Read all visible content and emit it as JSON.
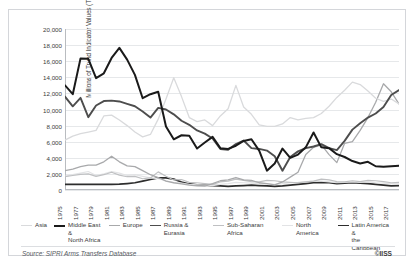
{
  "top_partial_title": "",
  "source_note": "Source: SIPRI Arms Transfers Database",
  "copyright": "©IISS",
  "chart_data": {
    "type": "line",
    "title": "",
    "xlabel": "",
    "ylabel": "Millions of Trend Indicator Values (TIV)",
    "ylim": [
      0,
      20000
    ],
    "ytick_values": [
      0,
      2000,
      4000,
      6000,
      8000,
      10000,
      12000,
      14000,
      16000,
      18000,
      20000
    ],
    "ytick_labels": [
      "0",
      "2,000",
      "4,000",
      "6,000",
      "8,000",
      "10,000",
      "12,000",
      "14,000",
      "16,000",
      "18,000",
      "20,000"
    ],
    "grid": true,
    "legend_position": "bottom",
    "x": [
      1975,
      1976,
      1977,
      1978,
      1979,
      1980,
      1981,
      1982,
      1983,
      1984,
      1985,
      1986,
      1987,
      1988,
      1989,
      1990,
      1991,
      1992,
      1993,
      1994,
      1995,
      1996,
      1997,
      1998,
      1999,
      2000,
      2001,
      2002,
      2003,
      2004,
      2005,
      2006,
      2007,
      2008,
      2009,
      2010,
      2011,
      2012,
      2013,
      2014,
      2015,
      2016,
      2017,
      2018
    ],
    "xtick_labels": [
      "1975",
      "1977",
      "1979",
      "1981",
      "1983",
      "1985",
      "1987",
      "1989",
      "1991",
      "1993",
      "1995",
      "1997",
      "1999",
      "2001",
      "2003",
      "2005",
      "2007",
      "2009",
      "2011",
      "2013",
      "2015",
      "2017"
    ],
    "series": [
      {
        "name": "Asia",
        "color": "#d9dadc",
        "width": 1.3,
        "values": [
          6200,
          6700,
          7000,
          7200,
          7400,
          9200,
          9300,
          8700,
          8000,
          7200,
          6600,
          6900,
          8800,
          11300,
          13950,
          11600,
          9000,
          8500,
          8700,
          8000,
          9200,
          10100,
          13000,
          10300,
          9400,
          8100,
          7900,
          7900,
          8200,
          9000,
          8700,
          8900,
          9000,
          9500,
          10400,
          11500,
          12400,
          13400,
          13100,
          12300,
          11400,
          11000,
          11300,
          10700
        ]
      },
      {
        "name": "Middle East & North Africa",
        "color": "#1a1a1a",
        "width": 2.0,
        "values": [
          13000,
          11900,
          16350,
          16300,
          13900,
          14500,
          16400,
          17650,
          16200,
          14300,
          11400,
          11900,
          12200,
          7900,
          6300,
          6800,
          6750,
          5150,
          5900,
          6600,
          5200,
          5100,
          5500,
          6100,
          6300,
          4900,
          2400,
          3300,
          5150,
          4000,
          4400,
          5300,
          7150,
          5300,
          5200,
          4450,
          4100,
          3600,
          3300,
          3500,
          2950,
          2900,
          2950,
          3000
        ]
      },
      {
        "name": "Europe",
        "color": "#a8a9ab",
        "width": 1.3,
        "values": [
          2400,
          2600,
          2900,
          3100,
          3100,
          3500,
          4200,
          3500,
          3000,
          2900,
          2400,
          1900,
          1550,
          1100,
          900,
          750,
          600,
          520,
          480,
          780,
          1150,
          1250,
          1550,
          1250,
          1200,
          900,
          780,
          650,
          1000,
          1600,
          2200,
          4400,
          5300,
          5600,
          4400,
          3400,
          5800,
          6000,
          7400,
          9000,
          10900,
          13200,
          12200,
          10700
        ]
      },
      {
        "name": "Russia & Eurasia",
        "color": "#4d4d4d",
        "width": 1.9,
        "values": [
          11600,
          10400,
          11450,
          9050,
          10500,
          11050,
          11100,
          11000,
          10700,
          10400,
          9750,
          9000,
          10200,
          10000,
          9400,
          8600,
          8100,
          7400,
          7000,
          6400,
          5100,
          5000,
          5700,
          6150,
          5200,
          5100,
          4900,
          4200,
          2400,
          4100,
          4800,
          5200,
          5400,
          5700,
          5200,
          4950,
          6100,
          7500,
          8300,
          9000,
          9500,
          10300,
          11800,
          12400
        ]
      },
      {
        "name": "Sub-Saharan Africa",
        "color": "#bfc0c2",
        "width": 1.2,
        "values": [
          1650,
          1800,
          1950,
          2000,
          1700,
          1900,
          2200,
          1850,
          1650,
          1700,
          1400,
          1500,
          2250,
          1700,
          1250,
          1300,
          950,
          900,
          800,
          700,
          1000,
          1100,
          1350,
          1200,
          1050,
          1000,
          1200,
          1150,
          1000,
          950,
          900,
          1000,
          1100,
          1350,
          1250,
          1050,
          1000,
          1150,
          1050,
          1200,
          1150,
          1050,
          900,
          950
        ]
      },
      {
        "name": "North America",
        "color": "#e2e3e5",
        "width": 1.2,
        "values": [
          1700,
          1900,
          2100,
          2300,
          1800,
          2000,
          2300,
          2100,
          1800,
          1900,
          1700,
          1500,
          1400,
          1150,
          900,
          850,
          700,
          650,
          600,
          550,
          700,
          800,
          950,
          900,
          850,
          800,
          750,
          700,
          800,
          900,
          950,
          1050,
          1100,
          1100,
          1000,
          900,
          950,
          1000,
          950,
          1000,
          900,
          850,
          800,
          750
        ]
      },
      {
        "name": "Latin America & the Caribbean",
        "color": "#2d2d2d",
        "width": 1.7,
        "values": [
          700,
          700,
          700,
          700,
          700,
          700,
          700,
          720,
          800,
          900,
          1100,
          1300,
          1500,
          1500,
          1350,
          1000,
          750,
          650,
          600,
          550,
          500,
          450,
          500,
          550,
          600,
          550,
          500,
          450,
          500,
          600,
          700,
          800,
          900,
          950,
          900,
          800,
          850,
          900,
          850,
          800,
          700,
          600,
          500,
          550
        ]
      }
    ]
  },
  "legend": {
    "items": [
      {
        "label": "Asia"
      },
      {
        "label": "Middle East &\nNorth Africa"
      },
      {
        "label": "Europe"
      },
      {
        "label": "Russia & Eurasia"
      },
      {
        "label": "Sub-Saharan Africa"
      },
      {
        "label": "North America"
      },
      {
        "label": "Latin America &\nthe Caribbean"
      }
    ]
  }
}
